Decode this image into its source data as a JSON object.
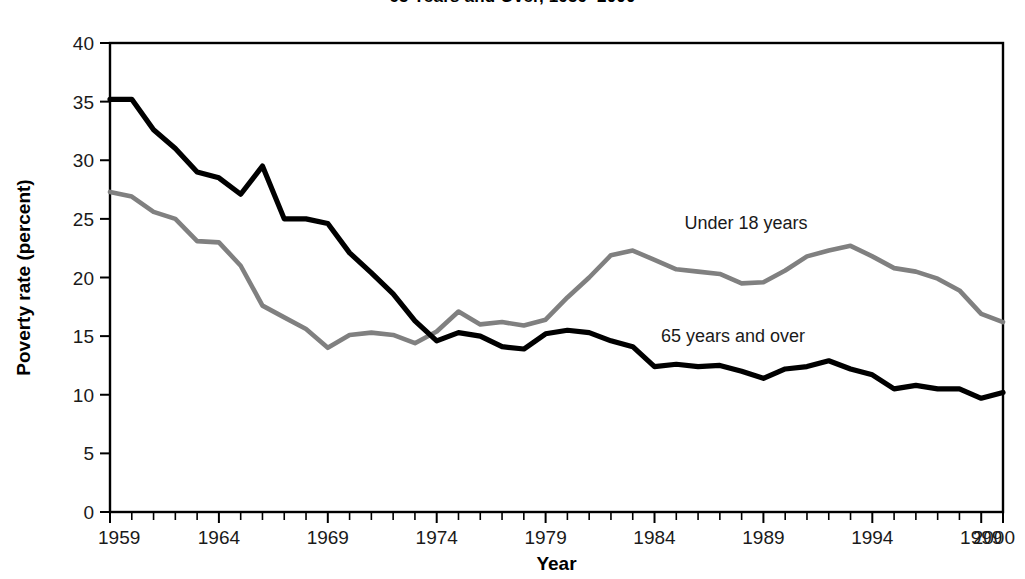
{
  "chart_data": {
    "type": "line",
    "title": "65 Years and Over, 1959–2000",
    "xlabel": "Year",
    "ylabel": "Poverty rate (percent)",
    "xlim": [
      1959,
      2000
    ],
    "ylim": [
      0,
      40
    ],
    "ytick_step": 5,
    "yticks": [
      0,
      5,
      10,
      15,
      20,
      25,
      30,
      35,
      40
    ],
    "ytick_labels": [
      "0",
      "5",
      "10",
      "15",
      "20",
      "25",
      "30",
      "35",
      "40"
    ],
    "xticks": [
      1959,
      1964,
      1969,
      1974,
      1979,
      1984,
      1989,
      1994,
      1999,
      2000
    ],
    "xtick_labels": [
      "1959",
      "1964",
      "1969",
      "1974",
      "1979",
      "1984",
      "1989",
      "1994",
      "1999",
      "2000"
    ],
    "xtick_minor_step": 1,
    "grid": false,
    "legend_position": "inline-annotations",
    "x": [
      1959,
      1960,
      1961,
      1962,
      1963,
      1964,
      1965,
      1966,
      1967,
      1968,
      1969,
      1970,
      1971,
      1972,
      1973,
      1974,
      1975,
      1976,
      1977,
      1978,
      1979,
      1980,
      1981,
      1982,
      1983,
      1984,
      1985,
      1986,
      1987,
      1988,
      1989,
      1990,
      1991,
      1992,
      1993,
      1994,
      1995,
      1996,
      1997,
      1998,
      1999,
      2000
    ],
    "series": [
      {
        "name": "Under 18 years",
        "color": "#808080",
        "label_text": "Under 18 years",
        "label_x": 1988.2,
        "label_y": 24.1,
        "values": [
          27.3,
          26.9,
          25.6,
          25.0,
          23.1,
          23.0,
          21.0,
          17.6,
          16.6,
          15.6,
          14.0,
          15.1,
          15.3,
          15.1,
          14.4,
          15.4,
          17.1,
          16.0,
          16.2,
          15.9,
          16.4,
          18.3,
          20.0,
          21.9,
          22.3,
          21.5,
          20.7,
          20.5,
          20.3,
          19.5,
          19.6,
          20.6,
          21.8,
          22.3,
          22.7,
          21.8,
          20.8,
          20.5,
          19.9,
          18.9,
          16.9,
          16.2
        ]
      },
      {
        "name": "65 years and over",
        "color": "#000000",
        "label_text": "65 years and over",
        "label_x": 1987.6,
        "label_y": 14.5,
        "values": [
          35.2,
          35.2,
          32.6,
          31.0,
          29.0,
          28.5,
          27.1,
          29.5,
          25.0,
          25.0,
          24.6,
          22.1,
          20.4,
          18.6,
          16.3,
          14.6,
          15.3,
          15.0,
          14.1,
          13.9,
          15.2,
          15.5,
          15.3,
          14.6,
          14.1,
          12.4,
          12.6,
          12.4,
          12.5,
          12.0,
          11.4,
          12.2,
          12.4,
          12.9,
          12.2,
          11.7,
          10.5,
          10.8,
          10.5,
          10.5,
          9.7,
          10.2
        ]
      }
    ]
  }
}
